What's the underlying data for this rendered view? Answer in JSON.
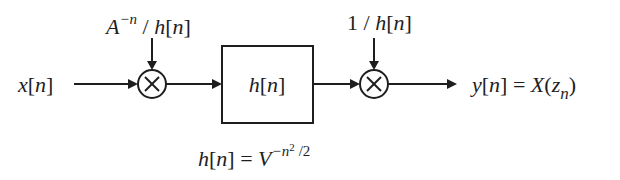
{
  "diagram": {
    "type": "signal-flow block diagram",
    "input": {
      "label": "x[n]",
      "var": "x",
      "idx": "n"
    },
    "multiplier1": {
      "symbol": "⊗",
      "control": {
        "base": "A",
        "exp": "−n",
        "rest": " / h[n]",
        "rest_var": "h",
        "rest_idx": "n"
      }
    },
    "filter_block": {
      "label_var": "h",
      "label_idx": "n",
      "label": "h[n]"
    },
    "multiplier2": {
      "symbol": "⊗",
      "control": {
        "num": "1",
        "sep": " / ",
        "var": "h",
        "idx": "n",
        "label": "1 / h[n]"
      }
    },
    "output": {
      "lhs_var": "y",
      "lhs_idx": "n",
      "eq": "=",
      "rhs_fn": "X",
      "rhs_arg": "z",
      "rhs_sub": "n",
      "label": "y[n] = X(z_n)"
    },
    "equation": {
      "lhs_var": "h",
      "lhs_idx": "n",
      "eq": "=",
      "base": "V",
      "exp_minus": "−n",
      "exp_sq": "2",
      "exp_div": "/2",
      "label": "h[n] = V^(−n²/2)"
    },
    "colors": {
      "ink": "#1e1e1e",
      "background": "#ffffff"
    }
  }
}
